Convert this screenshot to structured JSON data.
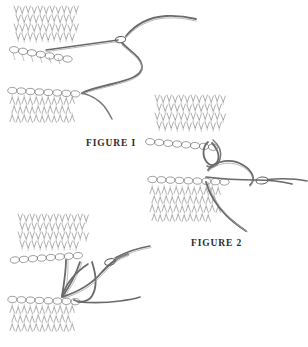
{
  "page": {
    "width": 308,
    "height": 347,
    "background_color": "#ffffff",
    "ink_color": "#4a4a4a",
    "label_color": "#2b2b2b",
    "medium": "pen-and-ink line drawing"
  },
  "labels": {
    "figure_1": "FIGURE I",
    "figure_2": "FIGURE 2"
  },
  "figures": [
    {
      "id": "figure-1",
      "label": "FIGURE I",
      "description": "Two knitted swatches, upper swatch with tapestry needle inserted horizontally through the live stitches along its lower edge, long working yarn trailing to the right in an S-curve down to the lower swatch.",
      "elements": [
        "upper-knit-swatch",
        "tapestry-needle",
        "working-yarn-s-curve",
        "lower-knit-swatch"
      ]
    },
    {
      "id": "figure-2",
      "label": "FIGURE 2",
      "description": "Upper and lower knitted swatches facing each other; working yarn forms a loop through the upper swatch edge stitch and a large loop passing to a threaded tapestry needle at the right.",
      "elements": [
        "upper-knit-swatch",
        "lower-knit-swatch",
        "yarn-loop-through-stitch",
        "large-yarn-loop",
        "threaded-tapestry-needle"
      ]
    },
    {
      "id": "figure-3",
      "label": "",
      "description": "Unlabeled third step: two knitted swatches joined with multiple vertical yarn strands forming the graft, needle entering from the right.",
      "elements": [
        "upper-knit-swatch",
        "lower-knit-swatch",
        "graft-yarn-strands",
        "tapestry-needle"
      ]
    }
  ]
}
